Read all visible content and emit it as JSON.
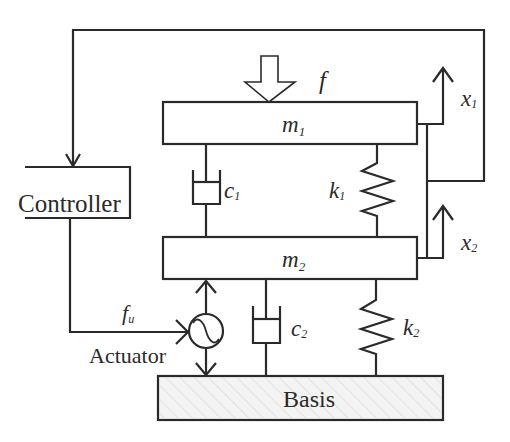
{
  "diagram": {
    "type": "two-mass active vibration isolation system",
    "colors": {
      "line": "#2a2a2a",
      "background": "#ffffff",
      "basis_fill": "#f3f3f3",
      "hatch": "#d6d6d6"
    },
    "blocks": {
      "controller": "Controller",
      "actuator": "Actuator",
      "basis": "Basis"
    },
    "masses": {
      "m1": {
        "symbol": "m",
        "sub": "1"
      },
      "m2": {
        "symbol": "m",
        "sub": "2"
      }
    },
    "dampers": {
      "c1": {
        "symbol": "c",
        "sub": "1"
      },
      "c2": {
        "symbol": "c",
        "sub": "2"
      }
    },
    "springs": {
      "k1": {
        "symbol": "k",
        "sub": "1"
      },
      "k2": {
        "symbol": "k",
        "sub": "2"
      }
    },
    "signals": {
      "disturbance_force": {
        "symbol": "f"
      },
      "control_force": {
        "symbol": "f",
        "sub": "u"
      },
      "x1": {
        "symbol": "x",
        "sub": "1"
      },
      "x2": {
        "symbol": "x",
        "sub": "2"
      }
    }
  }
}
